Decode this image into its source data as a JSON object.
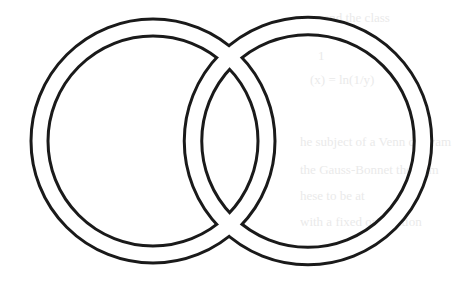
{
  "figure": {
    "background": "#ffffff",
    "stroke_color": "#1a1a1a",
    "line_width": 3,
    "rings": [
      {
        "name": "left-ring",
        "cx": 153,
        "cy": 141,
        "band_radius": 113.5,
        "band_width": 17
      },
      {
        "name": "right-ring",
        "cx": 308,
        "cy": 141,
        "band_radius": 115,
        "band_width": 17.5
      }
    ]
  },
  "bleed_through_text": [
    {
      "text": "rem and the class",
      "x": 300,
      "y": 22
    },
    {
      "text": "1",
      "x": 318,
      "y": 60
    },
    {
      "text": "(x) = ln(1/y)",
      "x": 310,
      "y": 84
    },
    {
      "text": "he subject of a Venn diagram",
      "x": 300,
      "y": 146
    },
    {
      "text": "the Gauss-Bonnet theorem",
      "x": 300,
      "y": 174
    },
    {
      "text": "hese to be at",
      "x": 300,
      "y": 200
    },
    {
      "text": "with a fixed orientation",
      "x": 300,
      "y": 226
    }
  ]
}
